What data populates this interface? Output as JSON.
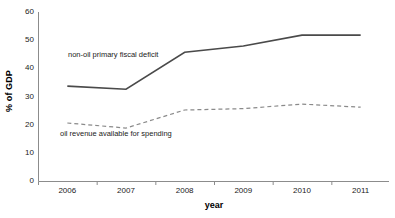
{
  "axes": {
    "y_title": "% of GDP",
    "x_title": "year",
    "y_ticks": [
      "0",
      "10",
      "20",
      "30",
      "40",
      "50",
      "60"
    ],
    "x_ticks": [
      "2006",
      "2007",
      "2008",
      "2009",
      "2010",
      "2011"
    ]
  },
  "annotations": {
    "deficit_label": "non-oil primary fiscal deficit",
    "oil_label": "oil revenue available for spending"
  },
  "colors": {
    "deficit_line": "#4a4a4a",
    "oil_line": "#8a8a8a",
    "axis": "#8c8c8c"
  },
  "chart_data": {
    "type": "line",
    "title": "",
    "xlabel": "year",
    "ylabel": "% of GDP",
    "categories": [
      "2006",
      "2007",
      "2008",
      "2009",
      "2010",
      "2011"
    ],
    "ylim": [
      0,
      60
    ],
    "xlim_note": "category axis, points centered between ticks",
    "grid": false,
    "legend": "inline annotations",
    "series": [
      {
        "name": "non-oil primary fiscal deficit",
        "style": "solid",
        "color": "#4a4a4a",
        "values": [
          33.7,
          32.6,
          45.7,
          47.9,
          51.8,
          51.8
        ]
      },
      {
        "name": "oil revenue available for spending",
        "style": "dashed",
        "color": "#8a8a8a",
        "values": [
          20.6,
          18.8,
          25.2,
          25.7,
          27.3,
          26.2
        ]
      }
    ]
  }
}
